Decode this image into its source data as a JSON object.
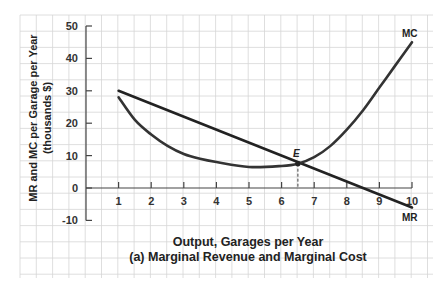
{
  "chart_data": {
    "type": "line",
    "title": "(a) Marginal Revenue and Marginal Cost",
    "xlabel": "Output, Garages per Year",
    "ylabel": "MR and MC per Garage per Year",
    "ylabel_sub": "(thousands $)",
    "xlim": [
      0,
      10
    ],
    "ylim": [
      -10,
      50
    ],
    "x_ticks": [
      1,
      2,
      3,
      4,
      5,
      6,
      7,
      8,
      9,
      10
    ],
    "y_ticks": [
      -10,
      0,
      10,
      20,
      30,
      40,
      50
    ],
    "grid": true,
    "series": [
      {
        "name": "MR",
        "x": [
          1,
          2,
          3,
          4,
          5,
          6,
          6.5,
          7,
          8,
          9,
          10
        ],
        "values": [
          30,
          26,
          22.5,
          18.5,
          15,
          11,
          7.5,
          5.5,
          1.5,
          -2,
          -6
        ]
      },
      {
        "name": "MC",
        "x": [
          1,
          1.5,
          2,
          2.5,
          3,
          3.5,
          4,
          5,
          6,
          6.5,
          7,
          7.5,
          8,
          8.5,
          9,
          9.5,
          10
        ],
        "values": [
          28,
          21,
          16.5,
          13,
          10.5,
          9,
          8,
          6.5,
          6.8,
          7.5,
          9.5,
          13,
          18,
          24,
          31,
          38,
          45
        ]
      }
    ],
    "annotations": [
      {
        "label": "E",
        "x": 6.5,
        "y": 7.5,
        "type": "point",
        "dashed_drop_line": true
      },
      {
        "label": "MC",
        "position": "end of MC curve"
      },
      {
        "label": "MR",
        "position": "end of MR curve"
      }
    ]
  },
  "labels": {
    "ylabel": "MR and MC per Garage per Year",
    "ylabel_sub": "(thousands $)",
    "xlabel": "Output, Garages per Year",
    "caption": "(a) Marginal Revenue and Marginal Cost",
    "mc": "MC",
    "mr": "MR",
    "e": "E"
  }
}
